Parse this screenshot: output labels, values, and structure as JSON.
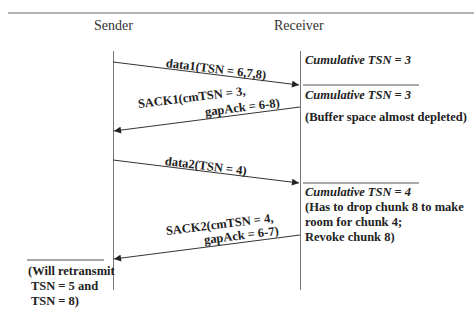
{
  "participants": {
    "sender": "Sender",
    "receiver": "Receiver"
  },
  "messages": [
    {
      "label": "data1(TSN = 6,7,8)",
      "direction": "sender-to-receiver"
    },
    {
      "label_line1": "SACK1(cmTSN = 3,",
      "label_line2": "gapAck = 6-8)",
      "direction": "receiver-to-sender"
    },
    {
      "label": "data2(TSN = 4)",
      "direction": "sender-to-receiver"
    },
    {
      "label_line1": "SACK2(cmTSN = 4,",
      "label_line2": "gapAck = 6-7)",
      "direction": "receiver-to-sender"
    }
  ],
  "receiver_notes": [
    {
      "cumulative": "Cumulative TSN = 3"
    },
    {
      "cumulative": "Cumulative TSN = 3",
      "text": "(Buffer space almost depleted)"
    },
    {
      "cumulative": "Cumulative TSN = 4",
      "line1": "(Has to drop chunk 8 to make",
      "line2": "room for chunk 4;",
      "line3": "Revoke chunk 8)"
    }
  ],
  "sender_note": {
    "line1": "(Will retransmit",
    "line2": " TSN = 5 and",
    "line3": " TSN = 8)"
  }
}
